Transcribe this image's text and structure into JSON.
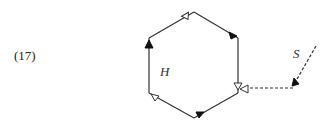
{
  "equation_number": "(17)",
  "labels": {
    "hexagon": "H",
    "external": "S"
  },
  "diagram": {
    "type": "hexagon-with-external-dotted-edge",
    "hexagon_vertices": [
      [
        194,
        12
      ],
      [
        238,
        38
      ],
      [
        238,
        93
      ],
      [
        194,
        118
      ],
      [
        149,
        93
      ],
      [
        149,
        38
      ]
    ],
    "hexagon_edges": [
      {
        "from": 5,
        "to": 0,
        "arrow": "open",
        "style": "solid"
      },
      {
        "from": 0,
        "to": 1,
        "arrow": "filled",
        "style": "solid"
      },
      {
        "from": 1,
        "to": 2,
        "arrow": "open",
        "style": "solid"
      },
      {
        "from": 2,
        "to": 3,
        "arrow": "filled",
        "style": "solid"
      },
      {
        "from": 3,
        "to": 4,
        "arrow": "open",
        "style": "solid"
      },
      {
        "from": 4,
        "to": 5,
        "arrow": "filled",
        "style": "solid"
      }
    ],
    "external_edges": [
      {
        "points": [
          [
            316,
            46
          ],
          [
            293,
            86
          ]
        ],
        "arrow": "filled",
        "style": "dashed"
      },
      {
        "points": [
          [
            293,
            86
          ],
          [
            240,
            93
          ]
        ],
        "arrow": "open",
        "style": "dashed"
      }
    ],
    "colors": {
      "line": "#333333",
      "fill": "#111111"
    }
  }
}
